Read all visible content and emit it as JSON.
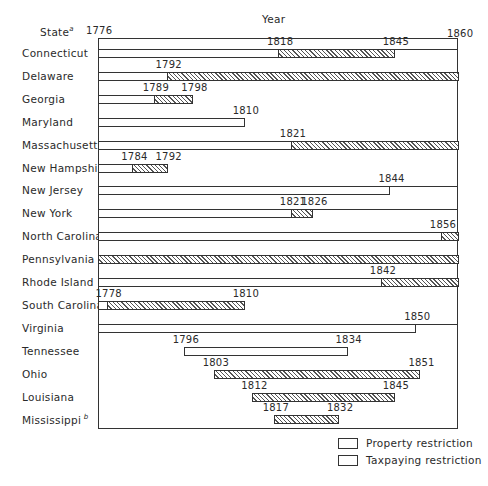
{
  "chart_data": {
    "type": "gantt-bar",
    "title": "",
    "xlabel": "Year",
    "ylabel": "State",
    "y_label_footnote": "a",
    "x_range": [
      1776,
      1860
    ],
    "x_tick_labels": [
      "1776",
      "1860"
    ],
    "grid": false,
    "legend_position": "bottom-right",
    "legend": [
      {
        "name": "Property restriction",
        "pattern": "open"
      },
      {
        "name": "Taxpaying restriction",
        "pattern": "hatched"
      }
    ],
    "series": [
      {
        "state": "Connecticut",
        "property": [
          1776,
          1818
        ],
        "taxpaying": [
          1818,
          1845
        ],
        "labels": [
          "1818",
          "1845"
        ],
        "second_line": true
      },
      {
        "state": "Delaware",
        "property": [
          1776,
          1792
        ],
        "taxpaying": [
          1792,
          1860
        ],
        "labels": [
          "1792"
        ]
      },
      {
        "state": "Georgia",
        "property": [
          1776,
          1789
        ],
        "taxpaying": [
          1789,
          1798
        ],
        "labels": [
          "1789",
          "1798"
        ]
      },
      {
        "state": "Maryland",
        "property": [
          1776,
          1810
        ],
        "taxpaying": null,
        "labels": [
          "1810"
        ]
      },
      {
        "state": "Massachusetts",
        "property": [
          1776,
          1821
        ],
        "taxpaying": [
          1821,
          1860
        ],
        "labels": [
          "1821"
        ],
        "second_line": true
      },
      {
        "state": "New Hampshire",
        "property": [
          1776,
          1784
        ],
        "taxpaying": [
          1784,
          1792
        ],
        "labels": [
          "1784",
          "1792"
        ]
      },
      {
        "state": "New Jersey",
        "property": [
          1776,
          1844
        ],
        "taxpaying": null,
        "labels": [
          "1844"
        ],
        "second_line": true
      },
      {
        "state": "New York",
        "property": [
          1776,
          1821
        ],
        "taxpaying": [
          1821,
          1826
        ],
        "labels": [
          "1821",
          "1826"
        ],
        "second_line": true
      },
      {
        "state": "North Carolina",
        "property": [
          1776,
          1856
        ],
        "taxpaying": [
          1856,
          1860
        ],
        "labels": [
          "1856"
        ],
        "second_line": true
      },
      {
        "state": "Pennsylvania",
        "property": null,
        "taxpaying": [
          1776,
          1860
        ],
        "labels": []
      },
      {
        "state": "Rhode Island",
        "property": [
          1776,
          1842
        ],
        "taxpaying": [
          1842,
          1860
        ],
        "labels": [
          "1842"
        ],
        "second_line": true
      },
      {
        "state": "South Carolina",
        "property": [
          1776,
          1778
        ],
        "taxpaying": [
          1778,
          1810
        ],
        "labels": [
          "1778",
          "1810"
        ]
      },
      {
        "state": "Virginia",
        "property": [
          1776,
          1850
        ],
        "taxpaying": null,
        "labels": [
          "1850"
        ],
        "second_line": true
      },
      {
        "state": "Tennessee",
        "property": [
          1796,
          1834
        ],
        "taxpaying": null,
        "labels": [
          "1796",
          "1834"
        ]
      },
      {
        "state": "Ohio",
        "property": null,
        "taxpaying": [
          1803,
          1851
        ],
        "labels": [
          "1803",
          "1851"
        ]
      },
      {
        "state": "Louisiana",
        "property": null,
        "taxpaying": [
          1812,
          1845
        ],
        "labels": [
          "1812",
          "1845"
        ]
      },
      {
        "state": "Mississippi",
        "property": null,
        "taxpaying": [
          1817,
          1832
        ],
        "labels": [
          "1817",
          "1832"
        ],
        "footnote": "b"
      }
    ]
  },
  "header": {
    "year_label": "Year",
    "state_label": "State",
    "state_footnote": "a",
    "start_year": "1776",
    "end_year": "1860"
  },
  "legend": {
    "property": "Property restriction",
    "taxpaying": "Taxpaying restriction"
  },
  "states": [
    "Connecticut",
    "Delaware",
    "Georgia",
    "Maryland",
    "Massachusetts",
    "New Hampshire",
    "New Jersey",
    "New York",
    "North Carolina",
    "Pennsylvania",
    "Rhode Island",
    "South Carolina",
    "Virginia",
    "Tennessee",
    "Ohio",
    "Louisiana",
    "Mississippi"
  ],
  "mississippi_footnote": "b"
}
